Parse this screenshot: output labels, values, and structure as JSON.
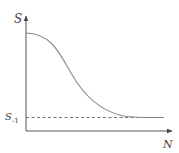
{
  "diagram": {
    "y_axis_label": "S",
    "x_axis_label": "N",
    "asymptote_label_main": "S",
    "asymptote_label_sub": "-1",
    "curve_description": "Decreasing sigmoid-shaped curve from top of S axis approaching dashed horizontal asymptote S_-1",
    "colors": {
      "axis": "#555555",
      "curve": "#888888",
      "dashed": "#666666"
    }
  }
}
